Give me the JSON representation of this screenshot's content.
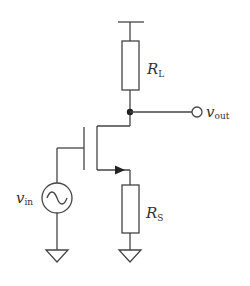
{
  "diagram": {
    "type": "circuit-schematic",
    "colors": {
      "wire": "#444444",
      "background": "#ffffff",
      "text": "#333333"
    },
    "components": {
      "supply": {
        "kind": "rail",
        "symbol": "supply-bar"
      },
      "load_resistor": {
        "kind": "resistor",
        "label_main": "R",
        "label_sub": "L"
      },
      "output_terminal": {
        "kind": "terminal",
        "label_main": "v",
        "label_sub": "out"
      },
      "transistor": {
        "kind": "n-mosfet"
      },
      "input_source": {
        "kind": "ac-voltage-source",
        "label_main": "v",
        "label_sub": "in"
      },
      "source_resistor": {
        "kind": "resistor",
        "label_main": "R",
        "label_sub": "S"
      },
      "ground_input": {
        "kind": "ground"
      },
      "ground_source": {
        "kind": "ground"
      }
    }
  }
}
